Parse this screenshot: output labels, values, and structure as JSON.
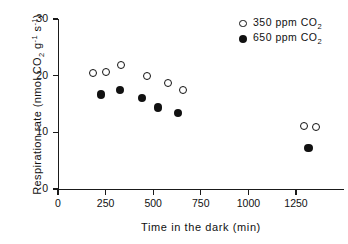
{
  "chart_data": {
    "type": "scatter",
    "title": "",
    "xlabel": "Time in the dark (min)",
    "ylabel": "Respiration rate (nmol CO2 g-1 s-1)",
    "ylabel_parts": {
      "prefix": "Respiration rate (nmol CO",
      "sub1": "2",
      "mid": " g",
      "sup1": "-1",
      "mid2": " s",
      "sup2": "-1",
      "suffix": ")"
    },
    "xlim": [
      0,
      1500
    ],
    "ylim": [
      0,
      30
    ],
    "xticks": [
      0,
      250,
      500,
      750,
      1000,
      1250
    ],
    "xtick_labels": [
      "0",
      "250",
      "500",
      "750",
      "1000",
      "1250"
    ],
    "yticks": [
      0,
      10,
      20,
      30
    ],
    "ytick_labels": [
      "0",
      "10",
      "20",
      "30"
    ],
    "grid": false,
    "legend_position": "top-right",
    "series": [
      {
        "name": "350 ppm CO2",
        "marker": "open-circle",
        "color": "#111111",
        "legend_label_prefix": "350  ppm  CO",
        "legend_label_sub": "2",
        "points": [
          {
            "x": 185,
            "y": 20.5
          },
          {
            "x": 250,
            "y": 20.7
          },
          {
            "x": 330,
            "y": 21.8
          },
          {
            "x": 465,
            "y": 20.0
          },
          {
            "x": 580,
            "y": 18.7
          },
          {
            "x": 655,
            "y": 17.5
          },
          {
            "x": 1290,
            "y": 11.1
          },
          {
            "x": 1355,
            "y": 11.0
          }
        ]
      },
      {
        "name": "650 ppm CO2",
        "marker": "filled-circle",
        "color": "#111111",
        "legend_label_prefix": "650  ppm  CO",
        "legend_label_sub": "2",
        "points": [
          {
            "x": 225,
            "y": 16.7
          },
          {
            "x": 325,
            "y": 17.5
          },
          {
            "x": 440,
            "y": 16.1
          },
          {
            "x": 525,
            "y": 14.4
          },
          {
            "x": 630,
            "y": 13.4
          },
          {
            "x": 1315,
            "y": 7.2
          }
        ]
      }
    ]
  }
}
